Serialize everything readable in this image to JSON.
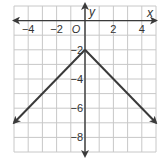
{
  "chart_data": {
    "type": "line",
    "title": "",
    "xlabel": "x",
    "ylabel": "y",
    "origin_label": "O",
    "xlim": [
      -5,
      5
    ],
    "ylim": [
      -9,
      1
    ],
    "grid": true,
    "x_ticks": [
      -4,
      -2,
      2,
      4
    ],
    "x_tick_labels": [
      "−4",
      "−2",
      "2",
      "4"
    ],
    "y_ticks": [
      -2,
      -4,
      -6,
      -8
    ],
    "y_tick_labels": [
      "−2",
      "−4",
      "−6",
      "−8"
    ],
    "series": [
      {
        "name": "y = -|x| - 2",
        "x": [
          -5,
          0,
          5
        ],
        "y": [
          -7,
          -2,
          -7
        ],
        "arrows_at_ends": true
      }
    ],
    "colors": {
      "grid": "#c8c8c8",
      "axis": "#3a3a3a",
      "line": "#3a3a3a",
      "background": "#ffffff"
    }
  }
}
